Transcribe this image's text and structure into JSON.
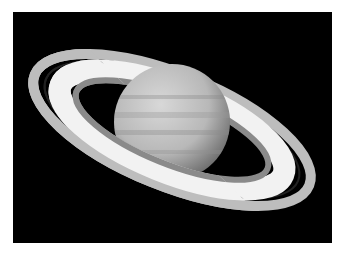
{
  "image": {
    "subject": "Saturn with rings",
    "background": "#000000",
    "border": "#ffffff"
  }
}
